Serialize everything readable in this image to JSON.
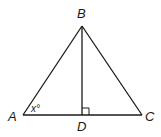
{
  "diagram": {
    "type": "triangle",
    "points": {
      "A": {
        "label": "A",
        "x": 23,
        "y": 115
      },
      "B": {
        "label": "B",
        "x": 82,
        "y": 26
      },
      "C": {
        "label": "C",
        "x": 142,
        "y": 115
      },
      "D": {
        "label": "D",
        "x": 82,
        "y": 115
      }
    },
    "segments": [
      "AB",
      "BC",
      "AC",
      "BD"
    ],
    "right_angle_at": "D",
    "angle_label": {
      "vertex": "A",
      "text": "x°"
    },
    "stroke_color": "#1a1a1a"
  }
}
